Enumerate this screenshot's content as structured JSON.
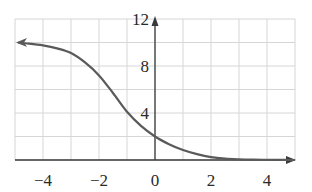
{
  "chart_data": {
    "type": "line",
    "title": "",
    "xlabel": "",
    "ylabel": "",
    "xlim": [
      -5,
      5
    ],
    "ylim": [
      0,
      12
    ],
    "grid": true,
    "x_grid_step": 1,
    "y_grid_step": 2,
    "x_ticks": [
      {
        "value": -4,
        "label": "−4"
      },
      {
        "value": -2,
        "label": "−2"
      },
      {
        "value": 0,
        "label": "0"
      },
      {
        "value": 2,
        "label": "2"
      },
      {
        "value": 4,
        "label": "4"
      }
    ],
    "y_ticks": [
      {
        "value": 4,
        "label": "4"
      },
      {
        "value": 8,
        "label": "8"
      },
      {
        "value": 12,
        "label": "12"
      }
    ],
    "series": [
      {
        "name": "decreasing logistic curve",
        "arrow_left": true,
        "x": [
          -5,
          -4.5,
          -4,
          -3.5,
          -3,
          -2.5,
          -2,
          -1.5,
          -1,
          -0.5,
          0,
          0.5,
          1,
          1.5,
          2,
          2.5,
          3,
          3.5,
          4,
          4.5,
          5
        ],
        "y": [
          10.0,
          9.9,
          9.75,
          9.5,
          9.1,
          8.3,
          7.2,
          5.7,
          4.1,
          2.9,
          2.0,
          1.35,
          0.85,
          0.5,
          0.25,
          0.12,
          0.06,
          0.03,
          0.02,
          0.01,
          0.0
        ]
      }
    ],
    "colors": {
      "curve": "#5a5a5a",
      "axes": "#3a3a3a",
      "grid": "#d6d6d6"
    }
  }
}
